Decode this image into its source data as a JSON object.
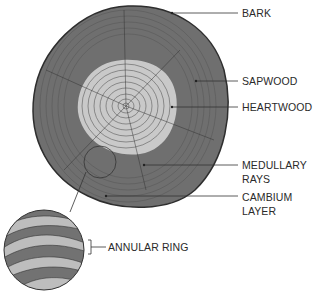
{
  "labels": {
    "bark": "BARK",
    "sapwood": "SAPWOOD",
    "heartwood": "HEARTWOOD",
    "medullary_1": "MEDULLARY",
    "medullary_2": "RAYS",
    "cambium_1": "CAMBIUM",
    "cambium_2": "LAYER",
    "annular": "ANNULAR RING"
  },
  "colors": {
    "sapwood": "#6f6f6f",
    "heartwood": "#c9c9c9",
    "ring_line": "#3a3a3a",
    "inset_light": "#bdbdbd",
    "inset_dark": "#727272"
  }
}
